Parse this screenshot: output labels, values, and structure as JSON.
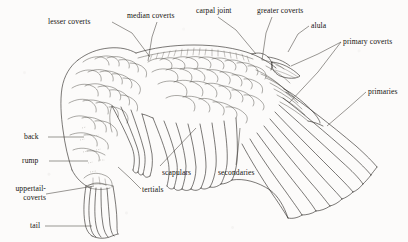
{
  "figure": {
    "background_color": "#fcfbfa",
    "ink_color": "#2a2723",
    "width": 408,
    "height": 242
  },
  "labels": [
    {
      "id": "lesser-coverts",
      "text": "lesser coverts",
      "x": 48,
      "y": 17
    },
    {
      "id": "median-coverts",
      "text": "median coverts",
      "x": 127,
      "y": 11
    },
    {
      "id": "carpal-joint",
      "text": "carpal joint",
      "x": 196,
      "y": 6
    },
    {
      "id": "greater-coverts",
      "text": "greater coverts",
      "x": 257,
      "y": 6
    },
    {
      "id": "alula",
      "text": "alula",
      "x": 311,
      "y": 21
    },
    {
      "id": "primary-coverts",
      "text": "primary coverts",
      "x": 343,
      "y": 37
    },
    {
      "id": "primaries",
      "text": "primaries",
      "x": 368,
      "y": 87
    },
    {
      "id": "back",
      "text": "back",
      "x": 24,
      "y": 132
    },
    {
      "id": "rump",
      "text": "rump",
      "x": 22,
      "y": 156
    },
    {
      "id": "uppertail-coverts",
      "text": "uppertail-coverts",
      "x": 2,
      "y": 184
    },
    {
      "id": "tail",
      "text": "tail",
      "x": 30,
      "y": 221
    },
    {
      "id": "scapulars",
      "text": "scapulars",
      "x": 162,
      "y": 168
    },
    {
      "id": "secondaries",
      "text": "secondaries",
      "x": 218,
      "y": 168
    },
    {
      "id": "tertials",
      "text": "tertials",
      "x": 142,
      "y": 185
    }
  ]
}
